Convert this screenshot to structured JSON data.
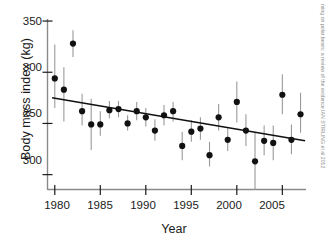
{
  "chart_data": {
    "type": "scatter",
    "title": "",
    "xlabel": "Year",
    "ylabel": "Body mass index (kg)",
    "xlim": [
      1979.2,
      2007.6
    ],
    "ylim": [
      185,
      352
    ],
    "grid": false,
    "legend": null,
    "xticks": [
      "1980",
      "1985",
      "1990",
      "1995",
      "2000",
      "2005"
    ],
    "xtick_values": [
      1980,
      1985,
      1990,
      1995,
      2000,
      2005
    ],
    "yticks": [
      "350",
      "300",
      "250",
      "300"
    ],
    "ytick_values": [
      350,
      300,
      250,
      200
    ],
    "series": [
      {
        "name": "Body mass index",
        "marker": "filled-circle",
        "errorbars": true,
        "points": [
          {
            "x": 1980,
            "y": 294,
            "lo": 265,
            "hi": 327
          },
          {
            "x": 1981,
            "y": 283,
            "lo": 252,
            "hi": 305
          },
          {
            "x": 1982,
            "y": 328,
            "lo": 315,
            "hi": 341
          },
          {
            "x": 1983,
            "y": 262,
            "lo": 248,
            "hi": 279
          },
          {
            "x": 1984,
            "y": 249,
            "lo": 224,
            "hi": 274
          },
          {
            "x": 1985,
            "y": 249,
            "lo": 238,
            "hi": 262
          },
          {
            "x": 1986,
            "y": 263,
            "lo": 255,
            "hi": 272
          },
          {
            "x": 1987,
            "y": 264,
            "lo": 256,
            "hi": 272
          },
          {
            "x": 1988,
            "y": 250,
            "lo": 243,
            "hi": 258
          },
          {
            "x": 1989,
            "y": 262,
            "lo": 253,
            "hi": 271
          },
          {
            "x": 1990,
            "y": 256,
            "lo": 247,
            "hi": 265
          },
          {
            "x": 1991,
            "y": 243,
            "lo": 233,
            "hi": 254
          },
          {
            "x": 1992,
            "y": 258,
            "lo": 248,
            "hi": 268
          },
          {
            "x": 1993,
            "y": 262,
            "lo": 252,
            "hi": 271
          },
          {
            "x": 1994,
            "y": 228,
            "lo": 214,
            "hi": 242
          },
          {
            "x": 1995,
            "y": 242,
            "lo": 232,
            "hi": 253
          },
          {
            "x": 1996,
            "y": 245,
            "lo": 234,
            "hi": 256
          },
          {
            "x": 1997,
            "y": 219,
            "lo": 208,
            "hi": 232
          },
          {
            "x": 1998,
            "y": 256,
            "lo": 243,
            "hi": 269
          },
          {
            "x": 1999,
            "y": 234,
            "lo": 223,
            "hi": 245
          },
          {
            "x": 2000,
            "y": 271,
            "lo": 251,
            "hi": 291
          },
          {
            "x": 2001,
            "y": 243,
            "lo": 228,
            "hi": 259
          },
          {
            "x": 2002,
            "y": 213,
            "lo": 185,
            "hi": 241
          },
          {
            "x": 2003,
            "y": 233,
            "lo": 219,
            "hi": 248
          },
          {
            "x": 2004,
            "y": 231,
            "lo": 214,
            "hi": 248
          },
          {
            "x": 2005,
            "y": 278,
            "lo": 259,
            "hi": 298
          },
          {
            "x": 2006,
            "y": 234,
            "lo": 220,
            "hi": 249
          },
          {
            "x": 2007,
            "y": 259,
            "lo": 241,
            "hi": 280
          }
        ]
      }
    ],
    "trendline": {
      "name": "linear regression",
      "x_start": 1979.7,
      "y_start": 275,
      "x_end": 2007.5,
      "y_end": 233
    }
  },
  "margin_note": {
    "text": "ming on polar bears: a review of the evidence IAN STIRLING et al 2012"
  }
}
